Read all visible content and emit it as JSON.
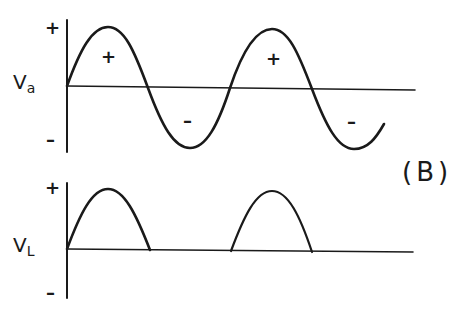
{
  "figure_label": "(B)",
  "colors": {
    "ink": "#1a1a1a",
    "background": "#ffffff"
  },
  "top_graph": {
    "axis_label_main": "V",
    "axis_label_sub": "a",
    "axis_plus": "+",
    "axis_minus": "–",
    "waveform": "full sine wave (AC source voltage)",
    "lobe_labels": [
      "+",
      "–",
      "+",
      "–"
    ]
  },
  "bottom_graph": {
    "axis_label_main": "V",
    "axis_label_sub": "L",
    "axis_plus": "+",
    "axis_minus": "–",
    "waveform": "half-wave rectified sine (load voltage)"
  }
}
